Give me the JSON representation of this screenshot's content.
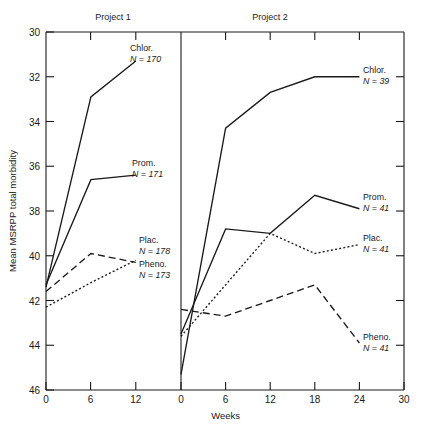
{
  "chart_data": {
    "type": "line",
    "title": "",
    "xlabel": "Weeks",
    "ylabel": "Mean MSRPP total morbidity",
    "ylim": [
      46,
      30
    ],
    "y_inverted": true,
    "grid": false,
    "legend_position": "inline-right-of-each-curve",
    "yticks": [
      "30",
      "32",
      "34",
      "36",
      "38",
      "40",
      "42",
      "44",
      "46"
    ],
    "ytick_values": [
      30,
      32,
      34,
      36,
      38,
      40,
      42,
      44,
      46
    ],
    "panels": [
      {
        "name": "Project 1",
        "xlim": [
          0,
          18
        ],
        "xticks": [
          "0",
          "6",
          "12"
        ],
        "xtick_values": [
          0,
          6,
          12
        ],
        "series": [
          {
            "name": "Chlor.",
            "n_label": "N = 170",
            "n": 170,
            "style": "solid",
            "x": [
              0,
              6,
              12
            ],
            "values": [
              41.4,
              32.9,
              31.3
            ]
          },
          {
            "name": "Prom.",
            "n_label": "N = 171",
            "n": 171,
            "style": "solid",
            "x": [
              0,
              6,
              12
            ],
            "values": [
              41.3,
              36.6,
              36.4
            ]
          },
          {
            "name": "Plac.",
            "n_label": "N = 178",
            "n": 178,
            "style": "dashed",
            "x": [
              0,
              6,
              12
            ],
            "values": [
              41.6,
              39.9,
              40.3
            ]
          },
          {
            "name": "Pheno.",
            "n_label": "N = 173",
            "n": 173,
            "style": "dotted",
            "x": [
              0,
              6,
              12
            ],
            "values": [
              42.3,
              41.2,
              40.2
            ]
          }
        ]
      },
      {
        "name": "Project 2",
        "xlim": [
          0,
          30
        ],
        "xticks": [
          "0",
          "6",
          "12",
          "18",
          "24",
          "30"
        ],
        "xtick_values": [
          0,
          6,
          12,
          18,
          24,
          30
        ],
        "series": [
          {
            "name": "Chlor.",
            "n_label": "N = 39",
            "n": 39,
            "style": "solid",
            "x": [
              0,
              6,
              12,
              18,
              24
            ],
            "values": [
              45.3,
              34.3,
              32.7,
              32.0,
              32.0
            ]
          },
          {
            "name": "Prom.",
            "n_label": "N = 41",
            "n": 41,
            "style": "solid",
            "x": [
              0,
              6,
              12,
              18,
              24
            ],
            "values": [
              43.5,
              38.8,
              39.0,
              37.3,
              37.9
            ]
          },
          {
            "name": "Plac.",
            "n_label": "N = 41",
            "n": 41,
            "style": "dotted",
            "x": [
              0,
              6,
              12,
              18,
              24
            ],
            "values": [
              43.6,
              41.3,
              39.0,
              39.9,
              39.5
            ]
          },
          {
            "name": "Pheno.",
            "n_label": "N = 41",
            "n": 41,
            "style": "dashed",
            "x": [
              0,
              6,
              12,
              18,
              24
            ],
            "values": [
              42.4,
              42.7,
              42.0,
              41.3,
              43.9
            ]
          }
        ]
      }
    ]
  }
}
